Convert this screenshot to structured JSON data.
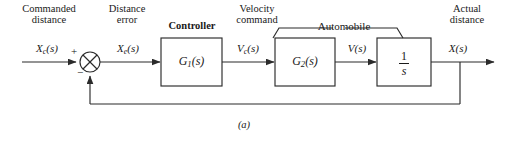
{
  "figure": {
    "caption": "(a)",
    "stroke_color": "#2b2b2b",
    "text_color": "#1a1a1a",
    "background": "#ffffff"
  },
  "annotations": {
    "commanded_distance": {
      "line1": "Commanded",
      "line2": "distance"
    },
    "distance_error": {
      "line1": "Distance",
      "line2": "error"
    },
    "controller": "Controller",
    "velocity_command": {
      "line1": "Velocity",
      "line2": "command"
    },
    "automobile": "Automobile",
    "actual_distance": {
      "line1": "Actual",
      "line2": "distance"
    }
  },
  "signals": {
    "input": {
      "base": "X",
      "sub": "c",
      "arg": "(s)"
    },
    "error": {
      "base": "X",
      "sub": "e",
      "arg": "(s)"
    },
    "velocity_command": {
      "base": "V",
      "sub": "c",
      "arg": "(s)"
    },
    "velocity": {
      "base": "V",
      "sub": "",
      "arg": "(s)"
    },
    "output": {
      "base": "X",
      "sub": "",
      "arg": "(s)"
    }
  },
  "summing_junction": {
    "name": "summing-junction",
    "plus_sign": "+",
    "minus_sign": "−"
  },
  "blocks": [
    {
      "id": "controller",
      "label_base": "G",
      "label_sub": "1",
      "label_arg": "(s)"
    },
    {
      "id": "plant",
      "label_base": "G",
      "label_sub": "2",
      "label_arg": "(s)"
    },
    {
      "id": "integrator",
      "numerator": "1",
      "denominator": "s"
    }
  ]
}
